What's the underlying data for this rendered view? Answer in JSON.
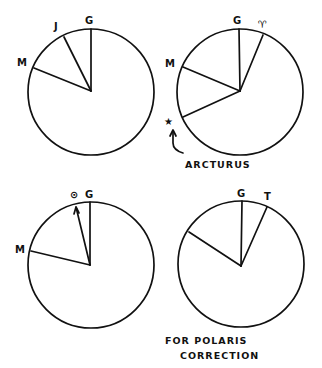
{
  "figure": {
    "type": "hand-drawn celestial angle diagrams",
    "panels": [
      {
        "id": "top-left",
        "labels": {
          "g": "G",
          "j": "J",
          "m": "M"
        }
      },
      {
        "id": "top-right",
        "labels": {
          "g": "G",
          "aries": "♈",
          "m": "M",
          "star": "★"
        },
        "annotation": "ARCTURUS"
      },
      {
        "id": "bottom-left",
        "labels": {
          "sun": "⊙",
          "g": "G",
          "m": "M"
        }
      },
      {
        "id": "bottom-right",
        "labels": {
          "g": "G",
          "aries": "T"
        },
        "caption": {
          "line1": "FOR POLARIS",
          "line2": "CORRECTION"
        }
      }
    ]
  },
  "colors": {
    "ink": "#111111",
    "paper": "#ffffff"
  }
}
